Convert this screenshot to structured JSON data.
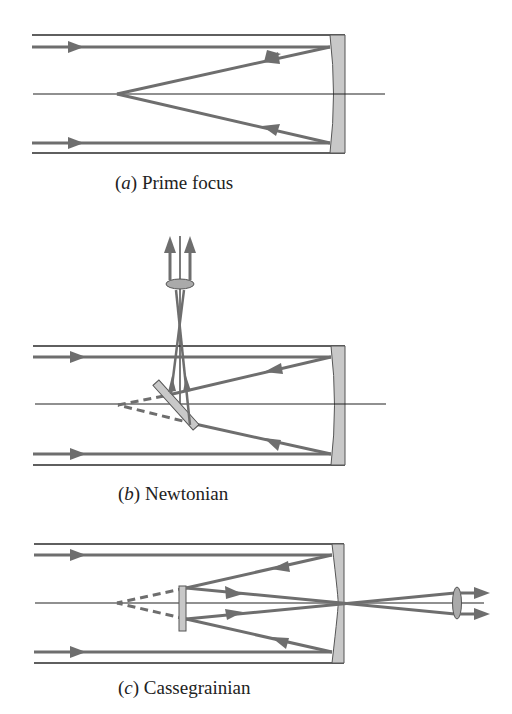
{
  "figure": {
    "colors": {
      "ray": "#6e6e6e",
      "tube": "#2a2a2a",
      "mirror_fill": "#c8c8c8",
      "mirror_stroke": "#555555",
      "axis": "#222222"
    },
    "panels": [
      {
        "id": "a",
        "letter": "a",
        "label": "Prime focus",
        "caption_x": 115,
        "caption_y": 172
      },
      {
        "id": "b",
        "letter": "b",
        "label": "Newtonian",
        "caption_x": 118,
        "caption_y": 483
      },
      {
        "id": "c",
        "letter": "c",
        "label": "Cassegrainian",
        "caption_x": 118,
        "caption_y": 677
      }
    ]
  }
}
